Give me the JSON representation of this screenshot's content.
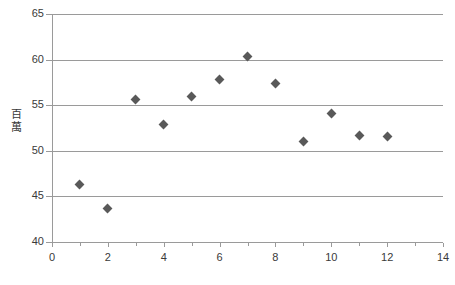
{
  "chart_data": {
    "type": "scatter",
    "title": "",
    "xlabel": "",
    "ylabel": "百萬",
    "xlim": [
      0,
      14
    ],
    "ylim": [
      40,
      65
    ],
    "grid": true,
    "legend": false,
    "marker": {
      "shape": "diamond",
      "color": "#595959",
      "size": 7
    },
    "axis_color": "#9a9a9a",
    "text_color": "#3a3a3a",
    "x_ticks": [
      0,
      2,
      4,
      6,
      8,
      10,
      12,
      14
    ],
    "x_tick_labels": [
      "0",
      "2",
      "4",
      "6",
      "8",
      "10",
      "12",
      "14"
    ],
    "x_minor_ticks": [
      1,
      3,
      5,
      7,
      9,
      11,
      13
    ],
    "y_ticks": [
      40,
      45,
      50,
      55,
      60,
      65
    ],
    "y_tick_labels": [
      "40",
      "45",
      "50",
      "55",
      "60",
      "65"
    ],
    "x": [
      1,
      2,
      3,
      4,
      5,
      6,
      7,
      8,
      9,
      10,
      11,
      12
    ],
    "values": [
      46.3,
      43.7,
      55.6,
      52.9,
      56.0,
      57.8,
      60.3,
      57.4,
      51.0,
      54.1,
      51.7,
      51.6
    ],
    "points": [
      {
        "x": 1,
        "y": 46.3
      },
      {
        "x": 2,
        "y": 43.7
      },
      {
        "x": 3,
        "y": 55.6
      },
      {
        "x": 4,
        "y": 52.9
      },
      {
        "x": 5,
        "y": 56.0
      },
      {
        "x": 6,
        "y": 57.8
      },
      {
        "x": 7,
        "y": 60.3
      },
      {
        "x": 8,
        "y": 57.4
      },
      {
        "x": 9,
        "y": 51.0
      },
      {
        "x": 10,
        "y": 54.1
      },
      {
        "x": 11,
        "y": 51.7
      },
      {
        "x": 12,
        "y": 51.6
      }
    ]
  },
  "y_axis_title_chars": [
    "百",
    "萬"
  ]
}
